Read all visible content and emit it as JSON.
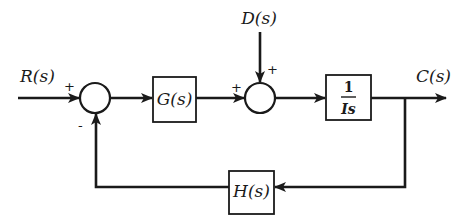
{
  "diagram": {
    "type": "feedback-control-block-diagram",
    "signals": {
      "input": "R(s)",
      "disturbance": "D(s)",
      "output": "C(s)"
    },
    "blocks": {
      "controller": "G(s)",
      "plant_numerator": "1",
      "plant_denominator": "Is",
      "feedback": "H(s)"
    },
    "junctions": {
      "summing_1": {
        "input_sign": "+",
        "feedback_sign": "-"
      },
      "summing_2": {
        "left_sign": "+",
        "top_sign": "+"
      }
    },
    "colors": {
      "line": "#1a1a1a",
      "background": "#ffffff"
    }
  }
}
